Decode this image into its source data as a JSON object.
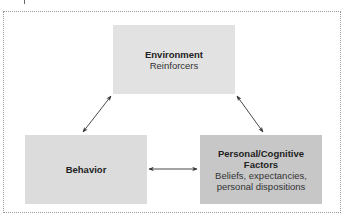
{
  "diagram": {
    "type": "reciprocal-determinism-triad",
    "nodes": [
      {
        "id": "environment",
        "title": "Environment",
        "subtitle": "Reinforcers",
        "fill": "#e2e2e2"
      },
      {
        "id": "behavior",
        "title": "Behavior",
        "subtitle": "",
        "fill": "#dcdcdc"
      },
      {
        "id": "personal",
        "title": "Personal/Cognitive Factors",
        "title_line1": "Personal/Cognitive",
        "title_line2": "Factors",
        "subtitle": "Beliefs, expectancies, personal dispositions",
        "subtitle_line1": "Beliefs, expectancies,",
        "subtitle_line2": "personal dispositions",
        "fill": "#c7c7c7"
      }
    ],
    "edges": [
      {
        "from": "environment",
        "to": "behavior",
        "bidirectional": true
      },
      {
        "from": "environment",
        "to": "personal",
        "bidirectional": true
      },
      {
        "from": "behavior",
        "to": "personal",
        "bidirectional": true
      }
    ],
    "colors": {
      "border": "#9a9a9a",
      "arrow": "#333333",
      "text": "#222222"
    }
  }
}
